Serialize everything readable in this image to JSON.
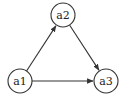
{
  "diagram": {
    "type": "directed-graph",
    "nodes": [
      {
        "id": "a1",
        "label": "a1",
        "cx": 20,
        "cy": 81,
        "r": 12
      },
      {
        "id": "a2",
        "label": "a2",
        "cx": 63,
        "cy": 15,
        "r": 12
      },
      {
        "id": "a3",
        "label": "a3",
        "cx": 106,
        "cy": 81,
        "r": 12
      }
    ],
    "edges": [
      {
        "from": "a1",
        "to": "a2"
      },
      {
        "from": "a2",
        "to": "a3"
      },
      {
        "from": "a1",
        "to": "a3"
      }
    ],
    "colors": {
      "stroke": "#333333",
      "fill": "#ffffff",
      "text": "#222222"
    }
  }
}
